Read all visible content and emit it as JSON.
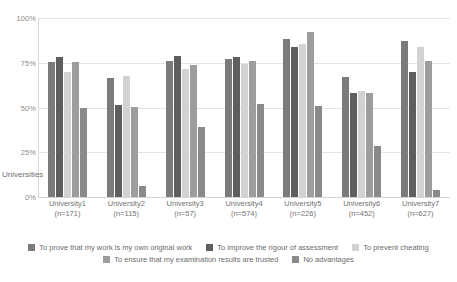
{
  "chart_data": {
    "type": "bar",
    "title": "",
    "xlabel": "Universities",
    "ylabel": "",
    "ylim": [
      0,
      100
    ],
    "grid": true,
    "legend_position": "bottom",
    "categories": [
      "University1\n(n=171)",
      "University2\n(n=115)",
      "University3\n(n=57)",
      "University4\n(n=574)",
      "University5\n(n=226)",
      "University6\n(n=452)",
      "University7\n(n=627)"
    ],
    "category_names": [
      "University1",
      "University2",
      "University3",
      "University4",
      "University5",
      "University6",
      "University7"
    ],
    "category_counts": [
      "(n=171)",
      "(n=115)",
      "(n=57)",
      "(n=574)",
      "(n=226)",
      "(n=452)",
      "(n=627)"
    ],
    "ytick_labels": [
      "100%",
      "75%",
      "50%",
      "25%",
      "0%"
    ],
    "ytick_values": [
      100,
      75,
      50,
      25,
      0
    ],
    "series": [
      {
        "name": "To prove that my work is my own original work",
        "color": "#7b7b7b",
        "values": [
          75.5,
          66.5,
          76.0,
          77.0,
          88.0,
          67.0,
          87.0
        ]
      },
      {
        "name": "To improve the rigour of assessment",
        "color": "#5e5e5e",
        "values": [
          78.0,
          51.5,
          79.0,
          78.0,
          84.0,
          58.0,
          70.0
        ]
      },
      {
        "name": "To prevent cheating",
        "color": "#d2d2d2",
        "values": [
          70.0,
          67.5,
          71.5,
          74.5,
          85.5,
          59.0,
          84.0
        ]
      },
      {
        "name": "To ensure that my examination results are trusted",
        "color": "#9d9d9d",
        "values": [
          75.5,
          50.5,
          74.0,
          76.0,
          92.0,
          58.0,
          76.0
        ]
      },
      {
        "name": "No advantages",
        "color": "#8a8a8a",
        "values": [
          49.5,
          6.0,
          39.0,
          52.0,
          51.0,
          28.5,
          4.0
        ]
      }
    ]
  },
  "legend": {
    "rows": [
      [
        {
          "label": "To prove that my work is my own original work",
          "color": "#7b7b7b"
        },
        {
          "label": "To improve the rigour of assessment",
          "color": "#5e5e5e"
        },
        {
          "label": "To prevent cheating",
          "color": "#d2d2d2"
        }
      ],
      [
        {
          "label": "To ensure that my examination results are trusted",
          "color": "#9d9d9d"
        },
        {
          "label": "No advantages",
          "color": "#8a8a8a"
        }
      ]
    ]
  }
}
